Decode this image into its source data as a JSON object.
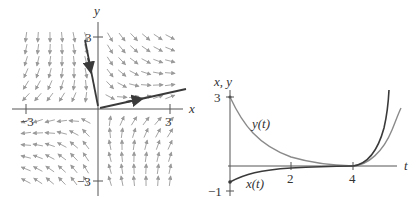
{
  "phase_portrait": {
    "axis_labels": {
      "x": "x",
      "y": "y"
    },
    "ticks": {
      "x_neg": "−3",
      "x_pos": "3",
      "y_pos": "3",
      "y_neg": "−3"
    },
    "range": [
      -3.5,
      3.5
    ],
    "eigen": {
      "unstable_dir": [
        4,
        1
      ],
      "stable_dir": [
        -1,
        4
      ],
      "lambda_unstable": 1,
      "lambda_stable": -1.5
    },
    "trajectory": {
      "start": [
        -0.55,
        2.95
      ],
      "end_at_origin": [
        0,
        0
      ],
      "exit_end": [
        3.7,
        0.85
      ]
    },
    "colors": {
      "axis": "#555555",
      "arrows": "#9a9a9a",
      "trajectory": "#3a3a3a"
    }
  },
  "time_plot": {
    "axis_labels": {
      "vertical": "x, y",
      "horizontal": "t"
    },
    "ticks": {
      "t2": "2",
      "t4": "4",
      "y3": "3",
      "yneg1": "−1"
    },
    "curve_labels": {
      "y": "y(t)",
      "x": "x(t)"
    },
    "colors": {
      "axis": "#555555",
      "x_curve": "#3a3a3a",
      "y_curve": "#8a8a8a"
    }
  },
  "chart_data": [
    {
      "type": "scatter",
      "title": "Phase portrait (saddle)",
      "xlabel": "x",
      "ylabel": "y",
      "xlim": [
        -3.5,
        3.5
      ],
      "ylim": [
        -3.5,
        3.5
      ],
      "tick_labels": {
        "x": [
          "−3",
          "3"
        ],
        "y": [
          "3",
          "−3"
        ]
      },
      "series": [
        {
          "name": "trajectory",
          "x": [
            -0.55,
            -0.3,
            0.0,
            1.2,
            2.5,
            3.7
          ],
          "y": [
            2.95,
            1.6,
            0.0,
            0.3,
            0.6,
            0.85
          ]
        }
      ],
      "annotations": [
        "direction field arrows"
      ],
      "grid": false
    },
    {
      "type": "line",
      "title": "",
      "xlabel": "t",
      "ylabel": "x, y",
      "xlim": [
        0,
        5.5
      ],
      "ylim": [
        -1,
        3.2
      ],
      "tick_labels": {
        "x": [
          "2",
          "4"
        ],
        "y": [
          "3",
          "−1"
        ]
      },
      "series": [
        {
          "name": "y(t)",
          "x": [
            0,
            0.5,
            1,
            2,
            3,
            4,
            4.5,
            5.0,
            5.5
          ],
          "y": [
            3.0,
            1.95,
            1.25,
            0.5,
            0.15,
            0.0,
            0.2,
            0.9,
            2.3
          ]
        },
        {
          "name": "x(t)",
          "x": [
            0,
            0.5,
            1,
            2,
            3,
            4,
            4.5,
            5.0,
            5.2
          ],
          "y": [
            -0.65,
            -0.4,
            -0.25,
            -0.08,
            -0.02,
            0.0,
            0.4,
            1.8,
            3.0
          ]
        }
      ],
      "grid": false,
      "legend": "inline labels"
    }
  ]
}
